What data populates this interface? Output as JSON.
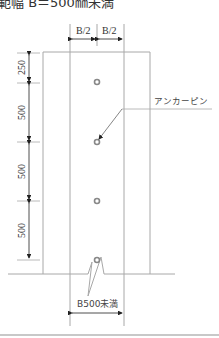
{
  "title": "範幅 B＝500㎜未満",
  "diagram": {
    "type": "anchor-pin-layout",
    "top_dimensions": [
      "B/2",
      "B/2"
    ],
    "left_dimensions": [
      "250",
      "500",
      "500",
      "500"
    ],
    "callout_label": "アンカーピン",
    "bottom_dimension": "B500未満",
    "pins_count": 4,
    "colors": {
      "line": "#9a9a9a",
      "dark": "#222222",
      "pin": "#888888"
    }
  }
}
